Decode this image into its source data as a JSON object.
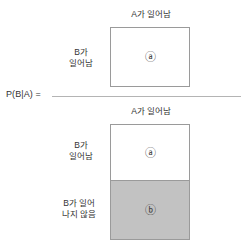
{
  "diagram": {
    "formula_label": "P(B|A) =",
    "colors": {
      "background": "#ffffff",
      "box_border": "#9a9a9a",
      "white_fill": "#ffffff",
      "gray_fill": "#c2c2c2",
      "text": "#333333",
      "fraction_bar": "#b4b4b4"
    },
    "numerator": {
      "top_label": "A가 일어남",
      "side_label": "B가\n일어남",
      "marker": "ⓐ",
      "fill": "white"
    },
    "denominator": {
      "top_label": "A가 일어남",
      "cells": [
        {
          "side_label": "B가\n일어남",
          "marker": "ⓐ",
          "fill": "white"
        },
        {
          "side_label": "B가 일어\n나지 않음",
          "marker": "ⓑ",
          "fill": "gray"
        }
      ]
    }
  }
}
